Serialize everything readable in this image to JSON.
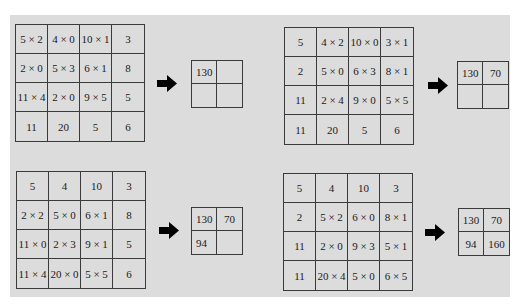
{
  "colors": {
    "panel": "#dcdcdc",
    "line": "#3a3a3a",
    "arrow": "#000000"
  },
  "steps": [
    {
      "input": [
        [
          "5 × 2",
          "4 × 0",
          "10 × 1",
          "3"
        ],
        [
          "2 × 0",
          "5 × 3",
          "6 × 1",
          "8"
        ],
        [
          "11 × 4",
          "2 × 0",
          "9 × 5",
          "5"
        ],
        [
          "11",
          "20",
          "5",
          "6"
        ]
      ],
      "arrow_icon": "right-arrow-icon",
      "output": [
        [
          "130",
          ""
        ],
        [
          "",
          ""
        ]
      ]
    },
    {
      "input": [
        [
          "5",
          "4 × 2",
          "10 × 0",
          "3 × 1"
        ],
        [
          "2",
          "5 × 0",
          "6 × 3",
          "8 × 1"
        ],
        [
          "11",
          "2 × 4",
          "9 × 0",
          "5 × 5"
        ],
        [
          "11",
          "20",
          "5",
          "6"
        ]
      ],
      "arrow_icon": "right-arrow-icon",
      "output": [
        [
          "130",
          "70"
        ],
        [
          "",
          ""
        ]
      ]
    },
    {
      "input": [
        [
          "5",
          "4",
          "10",
          "3"
        ],
        [
          "2 × 2",
          "5 × 0",
          "6 × 1",
          "8"
        ],
        [
          "11 × 0",
          "2 × 3",
          "9 × 1",
          "5"
        ],
        [
          "11 × 4",
          "20 × 0",
          "5 × 5",
          "6"
        ]
      ],
      "arrow_icon": "right-arrow-icon",
      "output": [
        [
          "130",
          "70"
        ],
        [
          "94",
          ""
        ]
      ]
    },
    {
      "input": [
        [
          "5",
          "4",
          "10",
          "3"
        ],
        [
          "2",
          "5 × 2",
          "6 × 0",
          "8 × 1"
        ],
        [
          "11",
          "2 × 0",
          "9 × 3",
          "5 × 1"
        ],
        [
          "11",
          "20 × 4",
          "5 × 0",
          "6 × 5"
        ]
      ],
      "arrow_icon": "right-arrow-icon",
      "output": [
        [
          "130",
          "70"
        ],
        [
          "94",
          "160"
        ]
      ]
    }
  ]
}
